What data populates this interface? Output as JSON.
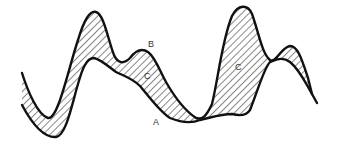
{
  "diagram": {
    "type": "two-curve hatched area diagram",
    "colors": {
      "stroke": "#111111",
      "hatch": "#222222",
      "background": "#ffffff"
    },
    "curves": [
      {
        "id": "A",
        "description": "lower curve"
      },
      {
        "id": "B",
        "description": "upper curve"
      }
    ],
    "regions": [
      {
        "id": "C",
        "description": "hatched region between curves (left)"
      },
      {
        "id": "C",
        "description": "hatched region between curves (right)"
      }
    ],
    "labels": {
      "a": "A",
      "b": "B",
      "c_left": "C",
      "c_right": "C"
    }
  }
}
